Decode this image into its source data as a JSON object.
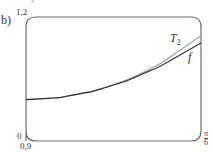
{
  "figure": {
    "part_label": "b)",
    "top_mark": "2"
  },
  "axes": {
    "y_max_label": "1,2",
    "y_min_label": "0",
    "x_min_label": "0,9",
    "x_max_numerator": "π",
    "x_max_denominator": "6"
  },
  "legend": {
    "t2_label": "T",
    "t2_sub": "2",
    "f_label": "f"
  },
  "colors": {
    "frame": "#6f6f6f",
    "t2": "#333333",
    "f": "#a8a8a8"
  },
  "chart_data": {
    "type": "line",
    "title": "",
    "xlabel": "",
    "ylabel": "",
    "xlim": [
      0,
      0.5236
    ],
    "ylim": [
      0.9,
      1.2
    ],
    "x_tick_labels": [
      "0",
      "π/6"
    ],
    "y_tick_labels": [
      "0,9",
      "1,2"
    ],
    "grid": false,
    "legend_position": "inline labels near right end",
    "series": [
      {
        "name": "T2",
        "x": [
          0,
          0.1,
          0.2,
          0.3,
          0.4,
          0.5236
        ],
        "values": [
          1.0,
          1.005,
          1.02,
          1.045,
          1.08,
          1.137
        ]
      },
      {
        "name": "f",
        "x": [
          0,
          0.1,
          0.2,
          0.3,
          0.4,
          0.5236
        ],
        "values": [
          1.0,
          1.005,
          1.0203,
          1.0467,
          1.0857,
          1.1547
        ]
      }
    ]
  }
}
